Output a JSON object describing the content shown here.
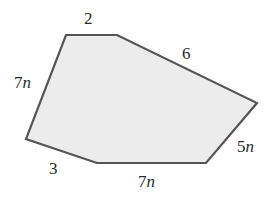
{
  "diagram": {
    "type": "hexagon",
    "fill_color": "#ececec",
    "stroke_color": "#555555",
    "vertices": [
      [
        66,
        35
      ],
      [
        117,
        35
      ],
      [
        257,
        103
      ],
      [
        206,
        163
      ],
      [
        97,
        163
      ],
      [
        26,
        139
      ]
    ],
    "sides": [
      {
        "id": "top",
        "num": "2",
        "var": ""
      },
      {
        "id": "upper-right",
        "num": "6",
        "var": ""
      },
      {
        "id": "right",
        "num": "5",
        "var": "n"
      },
      {
        "id": "bottom",
        "num": "7",
        "var": "n"
      },
      {
        "id": "bottom-left",
        "num": "3",
        "var": ""
      },
      {
        "id": "left",
        "num": "7",
        "var": "n"
      }
    ]
  }
}
